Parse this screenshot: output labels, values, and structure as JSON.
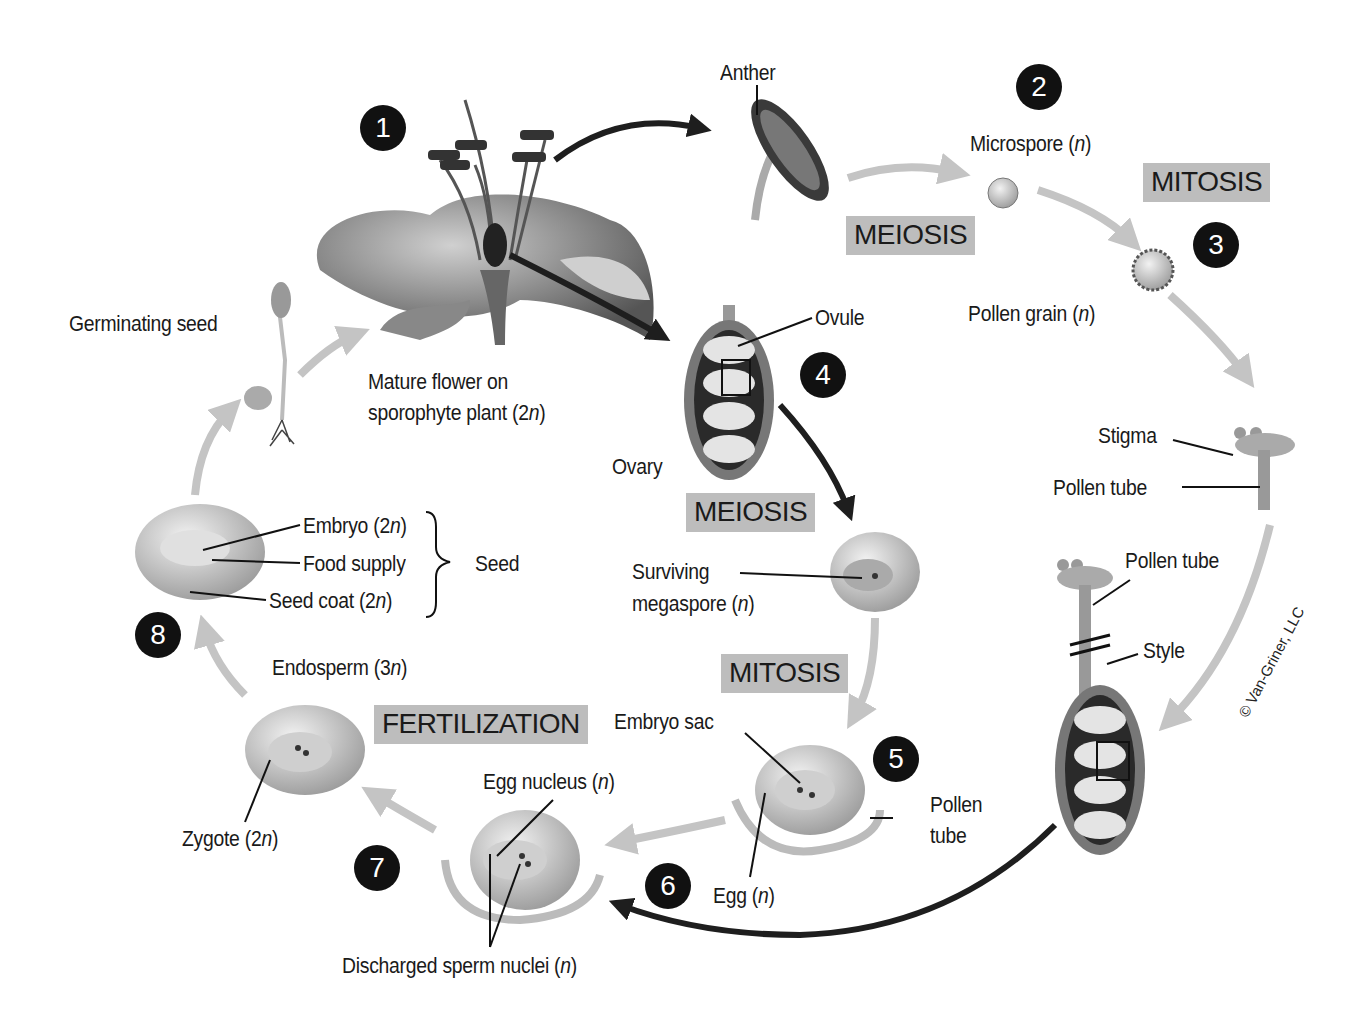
{
  "diagram": {
    "copyright": "© Van-Griner, LLC",
    "steps": [
      {
        "number": "1",
        "label": "Mature flower on sporophyte plant (2n)"
      },
      {
        "number": "2",
        "label": "Microspore (n)"
      },
      {
        "number": "3",
        "label": "Pollen grain (n)"
      },
      {
        "number": "4",
        "label": "Ovule"
      },
      {
        "number": "5",
        "label": "Embryo sac"
      },
      {
        "number": "6",
        "label": "Pollen tube"
      },
      {
        "number": "7",
        "label": "Discharged sperm nuclei (n)"
      },
      {
        "number": "8",
        "label": "Seed"
      }
    ],
    "processes": {
      "meiosis_top": "MEIOSIS",
      "mitosis_top": "MITOSIS",
      "meiosis_mid": "MEIOSIS",
      "mitosis_mid": "MITOSIS",
      "fertilization": "FERTILIZATION"
    },
    "labels": {
      "anther": "Anther",
      "microspore": "Microspore (",
      "pollen_grain": "Pollen grain (",
      "ovule": "Ovule",
      "ovary": "Ovary",
      "mature_flower_1": "Mature flower on",
      "mature_flower_2": "sporophyte plant (2",
      "germinating_seed": "Germinating seed",
      "stigma": "Stigma",
      "pollen_tube_1": "Pollen tube",
      "pollen_tube_2": "Pollen tube",
      "style": "Style",
      "surviving_1": "Surviving",
      "surviving_2": "megaspore (",
      "embryo": "Embryo (2",
      "food_supply": "Food supply",
      "seed_coat": "Seed coat (2",
      "seed": "Seed",
      "endosperm": "Endosperm (3",
      "zygote": "Zygote (2",
      "embryo_sac": "Embryo sac",
      "egg_nucleus": "Egg nucleus (",
      "egg": "Egg (",
      "pollen_tube_3a": "Pollen",
      "pollen_tube_3b": "tube",
      "sperm_nuclei": "Discharged sperm nuclei (",
      "n": "n",
      "close": ")"
    },
    "colors": {
      "badge": "#111111",
      "process_box": "#bdbdbd",
      "light_arrow": "#c4c4c4",
      "dark_arrow": "#1e1e1e"
    }
  }
}
